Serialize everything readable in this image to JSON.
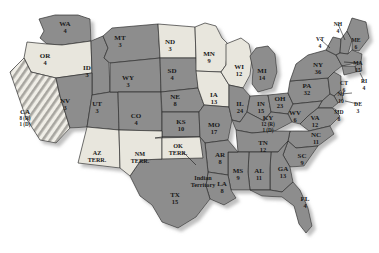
{
  "map": {
    "title": "United States Electoral Vote Map",
    "projection_note": "contiguous United States with territories",
    "colors": {
      "republican": "#8d8d8d",
      "democrat": "#e8e6dd",
      "hatched": "#b8b6ae",
      "border": "#2f2f2f",
      "shadow": "#cfcfcf",
      "background": "#ffffff",
      "label_text": "#1a1a1a"
    },
    "legend_note": "(R) = Republican electors, (D) = Democratic electors"
  },
  "states": [
    {
      "id": "WA",
      "abbr": "WA",
      "votes": "4",
      "party": "republican",
      "x": 65,
      "y": 26
    },
    {
      "id": "OR",
      "abbr": "OR",
      "votes": "4",
      "party": "democrat",
      "x": 45,
      "y": 58
    },
    {
      "id": "CA",
      "abbr": "CA",
      "votes": "",
      "party": "hatched",
      "x": 25,
      "y": 114,
      "split": {
        "r": "8 (R)",
        "d": "1 (D)"
      }
    },
    {
      "id": "ID",
      "abbr": "ID",
      "votes": "3",
      "party": "republican",
      "x": 87,
      "y": 70
    },
    {
      "id": "NV",
      "abbr": "NV",
      "votes": "3",
      "party": "republican",
      "x": 65,
      "y": 103
    },
    {
      "id": "UT",
      "abbr": "UT",
      "votes": "3",
      "party": "republican",
      "x": 97,
      "y": 106
    },
    {
      "id": "MT",
      "abbr": "MT",
      "votes": "3",
      "party": "republican",
      "x": 120,
      "y": 40
    },
    {
      "id": "WY",
      "abbr": "WY",
      "votes": "3",
      "party": "republican",
      "x": 128,
      "y": 80
    },
    {
      "id": "CO",
      "abbr": "CO",
      "votes": "4",
      "party": "republican",
      "x": 136,
      "y": 118
    },
    {
      "id": "ND",
      "abbr": "ND",
      "votes": "3",
      "party": "democrat",
      "x": 170,
      "y": 44
    },
    {
      "id": "SD",
      "abbr": "SD",
      "votes": "4",
      "party": "republican",
      "x": 172,
      "y": 73
    },
    {
      "id": "NE",
      "abbr": "NE",
      "votes": "8",
      "party": "republican",
      "x": 175,
      "y": 99
    },
    {
      "id": "KS",
      "abbr": "KS",
      "votes": "10",
      "party": "republican",
      "x": 181,
      "y": 124
    },
    {
      "id": "MN",
      "abbr": "MN",
      "votes": "9",
      "party": "democrat",
      "x": 209,
      "y": 56
    },
    {
      "id": "IA",
      "abbr": "IA",
      "votes": "13",
      "party": "democrat",
      "x": 214,
      "y": 97
    },
    {
      "id": "WI",
      "abbr": "WI",
      "votes": "12",
      "party": "democrat",
      "x": 239,
      "y": 69
    },
    {
      "id": "MO",
      "abbr": "MO",
      "votes": "17",
      "party": "republican",
      "x": 214,
      "y": 127
    },
    {
      "id": "IL",
      "abbr": "IL",
      "votes": "24",
      "party": "republican",
      "x": 240,
      "y": 106
    },
    {
      "id": "MI",
      "abbr": "MI",
      "votes": "14",
      "party": "republican",
      "x": 262,
      "y": 73
    },
    {
      "id": "IN",
      "abbr": "IN",
      "votes": "15",
      "party": "republican",
      "x": 261,
      "y": 106
    },
    {
      "id": "OH",
      "abbr": "OH",
      "votes": "23",
      "party": "republican",
      "x": 280,
      "y": 101
    },
    {
      "id": "KY",
      "abbr": "KY",
      "votes": "",
      "party": "republican",
      "x": 268,
      "y": 120,
      "split": {
        "r": "12 (R)",
        "d": "1 (D)"
      }
    },
    {
      "id": "WV",
      "abbr": "WV",
      "votes": "6",
      "party": "republican",
      "x": 295,
      "y": 115
    },
    {
      "id": "VA",
      "abbr": "VA",
      "votes": "12",
      "party": "republican",
      "x": 315,
      "y": 120
    },
    {
      "id": "PA",
      "abbr": "PA",
      "votes": "32",
      "party": "republican",
      "x": 307,
      "y": 88
    },
    {
      "id": "NY",
      "abbr": "NY",
      "votes": "36",
      "party": "republican",
      "x": 318,
      "y": 67
    },
    {
      "id": "VT",
      "abbr": "VT",
      "votes": "4",
      "party": "republican",
      "x": 320,
      "y": 41
    },
    {
      "id": "NH",
      "abbr": "NH",
      "votes": "4",
      "party": "republican",
      "x": 338,
      "y": 26
    },
    {
      "id": "ME",
      "abbr": "ME",
      "votes": "6",
      "party": "republican",
      "x": 356,
      "y": 42
    },
    {
      "id": "MA",
      "abbr": "MA",
      "votes": "15",
      "party": "republican",
      "x": 358,
      "y": 65
    },
    {
      "id": "RI",
      "abbr": "RI",
      "votes": "4",
      "party": "republican",
      "x": 364,
      "y": 83
    },
    {
      "id": "CT",
      "abbr": "CT",
      "votes": "6",
      "party": "republican",
      "x": 344,
      "y": 85
    },
    {
      "id": "NJ",
      "abbr": "NJ",
      "votes": "10",
      "party": "republican",
      "x": 341,
      "y": 96
    },
    {
      "id": "DE",
      "abbr": "DE",
      "votes": "3",
      "party": "republican",
      "x": 358,
      "y": 106
    },
    {
      "id": "MD",
      "abbr": "MD",
      "votes": "8",
      "party": "republican",
      "x": 339,
      "y": 114
    },
    {
      "id": "NC",
      "abbr": "NC",
      "votes": "11",
      "party": "republican",
      "x": 316,
      "y": 137
    },
    {
      "id": "TN",
      "abbr": "TN",
      "votes": "12",
      "party": "republican",
      "x": 263,
      "y": 145
    },
    {
      "id": "SC",
      "abbr": "SC",
      "votes": "9",
      "party": "republican",
      "x": 302,
      "y": 158
    },
    {
      "id": "GA",
      "abbr": "GA",
      "votes": "13",
      "party": "republican",
      "x": 283,
      "y": 171
    },
    {
      "id": "AL",
      "abbr": "AL",
      "votes": "11",
      "party": "republican",
      "x": 259,
      "y": 173
    },
    {
      "id": "MS",
      "abbr": "MS",
      "votes": "9",
      "party": "republican",
      "x": 238,
      "y": 173
    },
    {
      "id": "AR",
      "abbr": "AR",
      "votes": "8",
      "party": "republican",
      "x": 220,
      "y": 157
    },
    {
      "id": "LA",
      "abbr": "LA",
      "votes": "8",
      "party": "republican",
      "x": 222,
      "y": 186
    },
    {
      "id": "TX",
      "abbr": "TX",
      "votes": "15",
      "party": "republican",
      "x": 175,
      "y": 197
    },
    {
      "id": "FL",
      "abbr": "FL",
      "votes": "4",
      "party": "republican",
      "x": 305,
      "y": 201
    }
  ],
  "territories": [
    {
      "id": "AZ",
      "line1": "AZ",
      "line2": "TERR.",
      "party": "democrat",
      "x": 97,
      "y": 155
    },
    {
      "id": "NM",
      "line1": "NM",
      "line2": "TERR.",
      "party": "democrat",
      "x": 140,
      "y": 156
    },
    {
      "id": "OK",
      "line1": "OK",
      "line2": "TERR.",
      "party": "democrat",
      "x": 178,
      "y": 148
    },
    {
      "id": "IT",
      "line1": "Indian",
      "line2": "Territory",
      "party": "republican",
      "x": 203,
      "y": 180
    }
  ]
}
